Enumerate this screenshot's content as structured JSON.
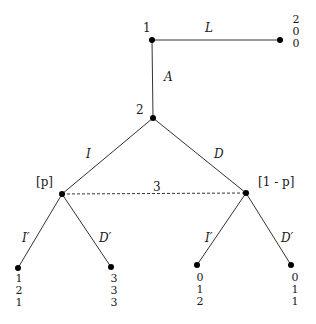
{
  "tree": {
    "nodes": {
      "root": {
        "player": "1"
      },
      "second": {
        "player": "2"
      },
      "info_set": {
        "player": "3",
        "left_belief": "[p]",
        "right_belief": "[1 - p]"
      }
    },
    "actions": {
      "root_leave": "L",
      "root_advance": "A",
      "p2_left": "I",
      "p2_right": "D",
      "p3_left_left": "I′",
      "p3_left_right": "D′",
      "p3_right_left": "I′",
      "p3_right_right": "D′"
    },
    "payoffs": {
      "L": [
        "2",
        "0",
        "0"
      ],
      "A_I_I": [
        "1",
        "2",
        "1"
      ],
      "A_I_D": [
        "3",
        "3",
        "3"
      ],
      "A_D_I": [
        "0",
        "1",
        "2"
      ],
      "A_D_D": [
        "0",
        "1",
        "1"
      ]
    }
  }
}
